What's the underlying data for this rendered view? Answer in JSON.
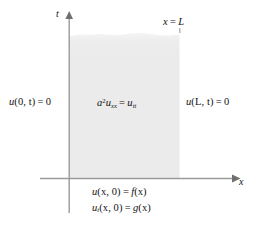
{
  "figure": {
    "domain_type": "semi-infinite-strip",
    "colors": {
      "background": "#ffffff",
      "strip_fill": "#ebebeb",
      "boundary_line": "#8a8a8a",
      "axis_line": "#9a9a9a",
      "text": "#111111"
    },
    "geometry": {
      "left_boundary_x": 69,
      "right_boundary_x": 180,
      "axis_y": 178,
      "strip_top_y": 33,
      "t_axis_top_y": 14,
      "t_axis_bottom_y": 213,
      "x_axis_left_x": 40,
      "x_axis_right_x": 236
    }
  },
  "axes": {
    "vertical_label": "t",
    "horizontal_label": "x"
  },
  "annotations": {
    "right_boundary_marker": {
      "lhs": "x",
      "relation": "=",
      "rhs": "L"
    },
    "boundary_condition_left": {
      "function": "u",
      "args": "(0, t)",
      "relation": "=",
      "value": "0"
    },
    "boundary_condition_right": {
      "function": "u",
      "args": "(L, t)",
      "relation": "=",
      "value": "0"
    },
    "pde": {
      "coefficient": "a",
      "coefficient_exponent": "2",
      "lhs_function": "u",
      "lhs_subscript": "xx",
      "relation": "=",
      "rhs_function": "u",
      "rhs_subscript": "tt"
    },
    "initial_condition_position": {
      "function": "u",
      "subscript": "",
      "args": "(x, 0)",
      "relation": "=",
      "rhs_function": "f",
      "rhs_args": "(x)"
    },
    "initial_condition_velocity": {
      "function": "u",
      "subscript": "t",
      "args": "(x, 0)",
      "relation": "=",
      "rhs_function": "g",
      "rhs_args": "(x)"
    }
  }
}
